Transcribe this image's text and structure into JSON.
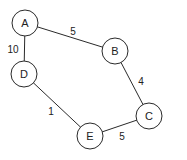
{
  "graph": {
    "style": {
      "stroke": "#2a2a2a",
      "node_fill": "#ffffff",
      "node_radius": 13
    },
    "nodes": [
      {
        "id": "A",
        "label": "A",
        "x": 25,
        "y": 23
      },
      {
        "id": "B",
        "label": "B",
        "x": 115,
        "y": 51
      },
      {
        "id": "C",
        "label": "C",
        "x": 149,
        "y": 116
      },
      {
        "id": "D",
        "label": "D",
        "x": 24,
        "y": 74
      },
      {
        "id": "E",
        "label": "E",
        "x": 90,
        "y": 136
      }
    ],
    "edges": [
      {
        "from": "A",
        "to": "B",
        "weight": "5",
        "lx": 73,
        "ly": 35
      },
      {
        "from": "A",
        "to": "D",
        "weight": "10",
        "lx": 13,
        "ly": 53
      },
      {
        "from": "B",
        "to": "C",
        "weight": "4",
        "lx": 141,
        "ly": 85
      },
      {
        "from": "D",
        "to": "E",
        "weight": "1",
        "lx": 51,
        "ly": 115
      },
      {
        "from": "E",
        "to": "C",
        "weight": "5",
        "lx": 122,
        "ly": 140
      }
    ]
  }
}
